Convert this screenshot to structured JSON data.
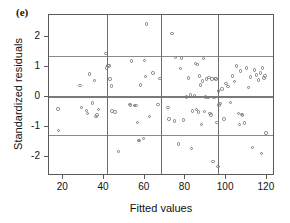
{
  "figure": {
    "panel_label": "(e)",
    "background_color": "#ffffff",
    "point_color": "#7b7b7b",
    "axis_color": "#5a5a5a",
    "reference_line_color": "#8a8a8a"
  },
  "chart_data": {
    "type": "scatter",
    "title": "(e)",
    "xlabel": "Fitted values",
    "ylabel": "Standardized residuals",
    "xlim": [
      13,
      124
    ],
    "ylim": [
      -2.65,
      2.72
    ],
    "xticks": [
      20,
      40,
      60,
      80,
      100,
      120
    ],
    "xtick_labels": [
      "20",
      "40",
      "60",
      "80",
      "100",
      "120"
    ],
    "yticks": [
      2,
      1,
      0,
      -1,
      -2
    ],
    "ytick_labels": [
      "2",
      "1",
      "0",
      "-1",
      "-2"
    ],
    "grid": false,
    "legend": null,
    "hlines": [
      1.36,
      0.02,
      -1.28
    ],
    "vlines": [
      41.5,
      68.0,
      96.0
    ],
    "marker": "open-circle",
    "x": [
      17.5,
      17.8,
      28.2,
      29.0,
      31.3,
      32.0,
      33.0,
      34.5,
      35.2,
      36.0,
      36.5,
      37.2,
      41.0,
      41.3,
      42.0,
      42.5,
      43.0,
      43.6,
      44.0,
      45.5,
      47.0,
      52.5,
      53.0,
      53.5,
      55.0,
      55.8,
      56.5,
      57.0,
      57.5,
      58.0,
      59.5,
      60.0,
      60.5,
      61.0,
      62.5,
      64.0,
      66.5,
      67.5,
      71.5,
      72.0,
      73.5,
      74.5,
      75.0,
      76.5,
      77.5,
      78.0,
      79.0,
      80.5,
      81.5,
      82.5,
      83.0,
      83.5,
      84.5,
      85.0,
      85.5,
      86.0,
      86.5,
      87.0,
      87.5,
      88.0,
      88.5,
      89.0,
      89.5,
      90.0,
      90.5,
      91.0,
      91.5,
      92.0,
      92.5,
      93.0,
      93.5,
      94.0,
      94.5,
      95.0,
      95.5,
      96.0,
      96.2,
      96.5,
      97.0,
      98.0,
      99.0,
      100.0,
      101.0,
      102.0,
      103.0,
      104.0,
      105.0,
      106.0,
      106.5,
      107.0,
      107.5,
      108.0,
      109.0,
      110.0,
      111.0,
      112.0,
      113.0,
      114.0,
      115.0,
      116.0,
      117.0,
      117.5,
      118.0,
      118.5,
      119.0,
      119.5
    ],
    "y": [
      -0.42,
      -1.14,
      0.37,
      -0.37,
      -0.46,
      -0.57,
      0.75,
      -0.21,
      0.54,
      -0.67,
      -0.62,
      -0.43,
      1.43,
      0.95,
      1.04,
      1.02,
      0.58,
      0.35,
      -0.48,
      -0.52,
      -1.84,
      -0.26,
      -0.28,
      1.18,
      -0.3,
      -0.3,
      -0.86,
      -1.47,
      -1.46,
      0.38,
      -1.4,
      1.2,
      0.66,
      2.42,
      -0.66,
      0.79,
      -0.27,
      0.6,
      -0.36,
      -0.75,
      2.11,
      -0.82,
      1.3,
      -1.58,
      0.93,
      1.28,
      -0.78,
      -0.02,
      0.62,
      0.05,
      -1.73,
      -0.48,
      0.03,
      1.11,
      -0.44,
      1.06,
      -0.52,
      0.68,
      0.38,
      -0.93,
      0.52,
      1.27,
      -0.5,
      -0.02,
      0.58,
      -0.04,
      0.63,
      -0.57,
      -0.62,
      0.58,
      -2.17,
      -0.03,
      0.6,
      0.58,
      -0.86,
      -2.33,
      0.18,
      -0.28,
      -0.23,
      0.25,
      -0.75,
      0.44,
      0.34,
      -0.2,
      0.68,
      0.5,
      1.02,
      -0.57,
      -0.93,
      0.85,
      -0.6,
      -0.62,
      -0.88,
      0.95,
      0.3,
      0.65,
      -1.7,
      0.88,
      0.72,
      0.55,
      0.78,
      -1.9,
      0.95,
      0.62,
      0.68,
      -1.22
    ]
  }
}
